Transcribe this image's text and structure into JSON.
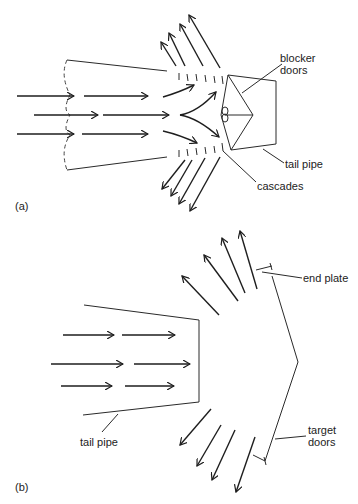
{
  "figure_a": {
    "panel_label": "(a)",
    "labels": {
      "blocker_doors_line1": "blocker",
      "blocker_doors_line2": "doors",
      "tail_pipe": "tail pipe",
      "cascades": "cascades"
    }
  },
  "figure_b": {
    "panel_label": "(b)",
    "labels": {
      "end_plate": "end plate",
      "tail_pipe": "tail pipe",
      "target_doors_line1": "target",
      "target_doors_line2": "doors"
    }
  }
}
